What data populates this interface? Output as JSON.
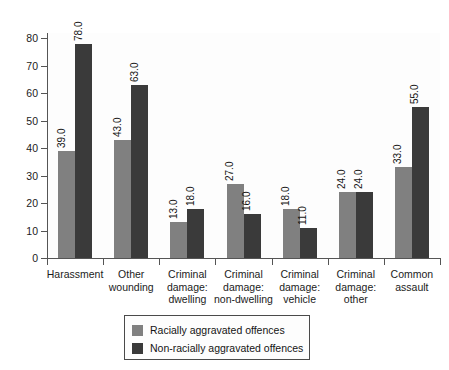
{
  "chart_data": {
    "type": "bar",
    "title": "",
    "subtitle": "",
    "xlabel": "",
    "ylabel": "",
    "ylim": [
      0,
      80
    ],
    "ytick_step": 10,
    "yticks": [
      "80",
      "70",
      "60",
      "50",
      "40",
      "30",
      "20",
      "10",
      "0"
    ],
    "grid": false,
    "legend_position": "bottom-center",
    "value_label_format": "one-decimal",
    "value_labels_rotated": true,
    "categories": [
      "Harassment",
      "Other wounding",
      "Criminal damage: dwelling",
      "Criminal damage: non-dwelling",
      "Criminal damage: vehicle",
      "Criminal damage: other",
      "Common assault"
    ],
    "category_lines": [
      [
        "Harassment"
      ],
      [
        "Other",
        "wounding"
      ],
      [
        "Criminal",
        "damage:",
        "dwelling"
      ],
      [
        "Criminal",
        "damage:",
        "non-dwelling"
      ],
      [
        "Criminal",
        "damage:",
        "vehicle"
      ],
      [
        "Criminal",
        "damage:",
        "other"
      ],
      [
        "Common",
        "assault"
      ]
    ],
    "series": [
      {
        "name": "Racially aggravated offences",
        "color": "#808080",
        "values": [
          39,
          43,
          13,
          27,
          18,
          24,
          33
        ],
        "labels": [
          "39.0",
          "43.0",
          "13.0",
          "27.0",
          "18.0",
          "24.0",
          "33.0"
        ]
      },
      {
        "name": "Non-racially aggravated offences",
        "color": "#3a3a3a",
        "values": [
          78,
          63,
          18,
          16,
          11,
          24,
          55
        ],
        "labels": [
          "78.0",
          "63.0",
          "18.0",
          "16.0",
          "11.0",
          "24.0",
          "55.0"
        ]
      }
    ]
  },
  "legend": {
    "items": [
      {
        "label": "Racially aggravated offences",
        "color": "#808080"
      },
      {
        "label": "Non-racially aggravated offences",
        "color": "#3a3a3a"
      }
    ]
  },
  "colors": {
    "series_racial": "#808080",
    "series_nonracial": "#3a3a3a",
    "axis": "#555555",
    "plot_background": "#fdfdfd",
    "page_background": "#ffffff",
    "text": "#1b1b1b"
  }
}
